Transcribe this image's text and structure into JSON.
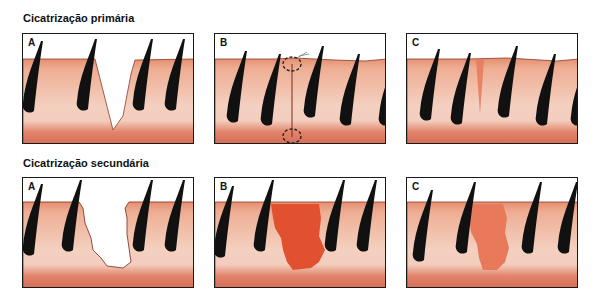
{
  "rows": [
    {
      "title": "Cicatrização primária",
      "panels": [
        {
          "label": "A",
          "stage": "wound-open-v-shaped"
        },
        {
          "label": "B",
          "stage": "wound-sutured"
        },
        {
          "label": "C",
          "stage": "thin-scar"
        }
      ]
    },
    {
      "title": "Cicatrização secundária",
      "panels": [
        {
          "label": "A",
          "stage": "wound-open-wide"
        },
        {
          "label": "B",
          "stage": "granulation-tissue"
        },
        {
          "label": "C",
          "stage": "wide-scar"
        }
      ]
    }
  ],
  "colors": {
    "skin_top": "#e9a184",
    "skin_mid": "#f2c2ae",
    "skin_bottom": "#d9765f",
    "skin_edge": "#8a3a28",
    "hair": "#111111",
    "granulation": "#e2512f",
    "scar": "#e8795a",
    "frame": "#1a1a1a"
  }
}
